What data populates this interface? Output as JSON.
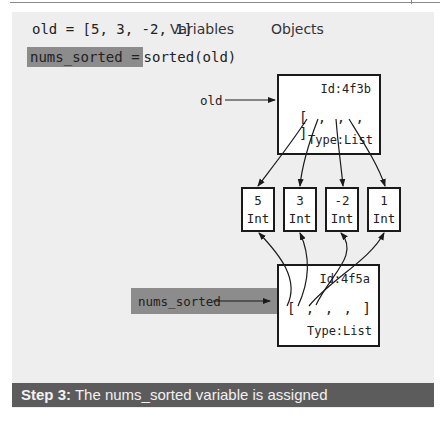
{
  "code": {
    "line1": "old = [5, 3, -2, 1]",
    "line2_highlight": "nums_sorted =",
    "line2_rest": "sorted(old)"
  },
  "headers": {
    "variables": "Variables",
    "objects": "Objects"
  },
  "variables": [
    {
      "name": "old",
      "points_to": "4f3b",
      "highlighted": false
    },
    {
      "name": "nums_sorted",
      "points_to": "4f5a",
      "highlighted": true
    }
  ],
  "objects": {
    "old_list": {
      "id_label": "Id:4f3b",
      "contents": "[ , , , ]",
      "type_label": "Type:List"
    },
    "new_list": {
      "id_label": "Id:4f5a",
      "contents": "[ , , , ]",
      "type_label": "Type:List"
    },
    "ints": [
      {
        "value": "5",
        "type": "Int"
      },
      {
        "value": "3",
        "type": "Int"
      },
      {
        "value": "-2",
        "type": "Int"
      },
      {
        "value": "1",
        "type": "Int"
      }
    ]
  },
  "caption": {
    "step": "Step 3:",
    "text": " The nums_sorted variable is assigned"
  },
  "colors": {
    "panel_bg": "#eeeeee",
    "highlight": "#8c8c8c",
    "caption_bg": "#5c5c5c"
  }
}
